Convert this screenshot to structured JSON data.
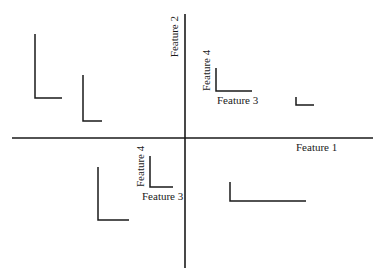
{
  "diagram": {
    "type": "glyph-scatter",
    "axes": {
      "x_label": "Feature 1",
      "y_label": "Feature 2",
      "x_axis": {
        "x1": 12,
        "x2": 373,
        "y": 138
      },
      "y_axis": {
        "x": 185,
        "y1": 14,
        "y2": 268
      },
      "x_label_pos": {
        "x": 296,
        "y": 151
      },
      "y_label_pos": {
        "x": 178,
        "y": 16
      }
    },
    "glyph_legend_labels": {
      "horizontal": "Feature 3",
      "vertical": "Feature 4"
    },
    "legends": [
      {
        "id": "legend-top-right",
        "x": 216,
        "top": 68,
        "bottom": 91,
        "right": 252,
        "h_label_pos": {
          "x": 217,
          "y": 104
        },
        "v_label_pos": {
          "x": 210,
          "y": 52
        }
      },
      {
        "id": "legend-bottom-left",
        "x": 150,
        "top": 156,
        "bottom": 187,
        "right": 173,
        "h_label_pos": {
          "x": 142,
          "y": 200
        },
        "v_label_pos": {
          "x": 144,
          "y": 146
        }
      }
    ],
    "glyphs": [
      {
        "x": 35,
        "top": 34,
        "bottom": 98,
        "right": 62
      },
      {
        "x": 83,
        "top": 75,
        "bottom": 121,
        "right": 102
      },
      {
        "x": 296,
        "top": 97,
        "bottom": 105,
        "right": 314
      },
      {
        "x": 98,
        "top": 167,
        "bottom": 220,
        "right": 129
      },
      {
        "x": 230,
        "top": 182,
        "bottom": 201,
        "right": 306
      }
    ]
  }
}
